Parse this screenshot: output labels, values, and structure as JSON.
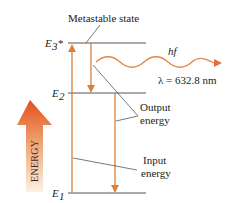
{
  "diagram": {
    "title_label": "Metastable state",
    "levels": [
      {
        "name": "E3*",
        "base": "E",
        "sub": "3",
        "sup": "*"
      },
      {
        "name": "E2",
        "base": "E",
        "sub": "2"
      },
      {
        "name": "E1",
        "base": "E",
        "sub": "1"
      }
    ],
    "photon": {
      "label": "hf",
      "wavelength": "λ = 632.8 nm"
    },
    "output_label": [
      "Output",
      "energy"
    ],
    "input_label": [
      "Input",
      "energy"
    ],
    "energy_arrow_label": "ENERGY",
    "colors": {
      "arrow": "#d9803a",
      "level_line": "#555555",
      "wave": "#e0874a",
      "energy_top": "#e0531e",
      "energy_bottom": "#fbe9d6"
    }
  }
}
